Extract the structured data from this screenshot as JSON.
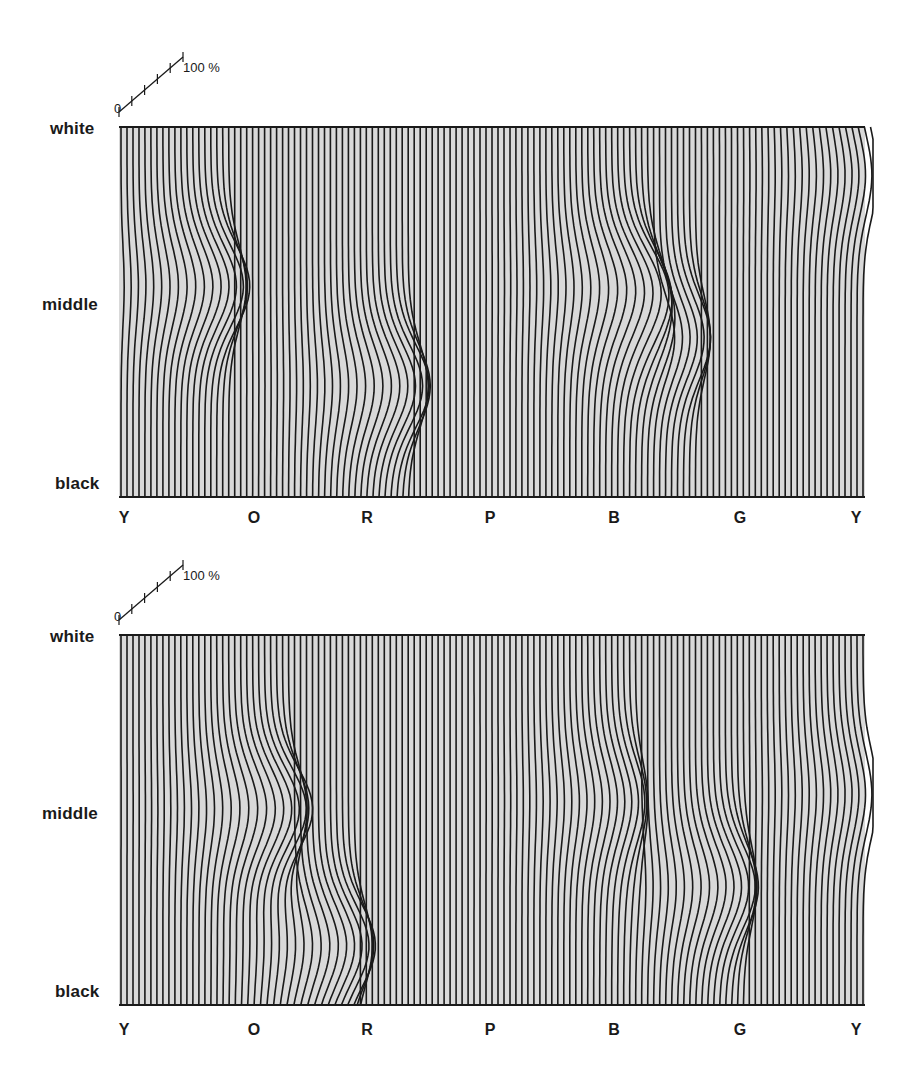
{
  "chart_data": [
    {
      "type": "line",
      "title": "",
      "description": "Hue circle (x) vs. lightness (y, white to black); vertical iso-hue lines displaced horizontally, scale 0-100 %",
      "xlabel": "hue",
      "ylabel": "lightness",
      "x_tick_labels": [
        "Y",
        "O",
        "R",
        "P",
        "B",
        "G",
        "Y"
      ],
      "y_tick_labels": [
        "white",
        "middle",
        "black"
      ],
      "scale_bar": {
        "min_label": "0",
        "max_label": "100 %",
        "ticks": 5
      },
      "line_count": 125,
      "grid": false,
      "deformations": [
        {
          "hue_pos": 0.13,
          "lightness": 0.43,
          "amplitude": 0.55,
          "note": "near O, just above middle"
        },
        {
          "hue_pos": 0.375,
          "lightness": 0.7,
          "amplitude": 0.55,
          "note": "before R, below middle"
        },
        {
          "hue_pos": 0.69,
          "lightness": 0.43,
          "amplitude": 0.55,
          "note": "near B, above middle"
        },
        {
          "hue_pos": 0.76,
          "lightness": 0.57,
          "amplitude": 0.45,
          "note": "between B and G, near middle"
        },
        {
          "hue_pos": 1.0,
          "lightness": 0.13,
          "amplitude": 0.25,
          "note": "at Y, near white"
        }
      ]
    },
    {
      "type": "line",
      "title": "",
      "description": "Second condition: same axes, different displacement pattern",
      "xlabel": "hue",
      "ylabel": "lightness",
      "x_tick_labels": [
        "Y",
        "O",
        "R",
        "P",
        "B",
        "G",
        "Y"
      ],
      "y_tick_labels": [
        "white",
        "middle",
        "black"
      ],
      "scale_bar": {
        "min_label": "0",
        "max_label": "100 %",
        "ticks": 5
      },
      "line_count": 125,
      "grid": false,
      "deformations": [
        {
          "hue_pos": 0.21,
          "lightness": 0.47,
          "amplitude": 0.6,
          "note": "near O, middle"
        },
        {
          "hue_pos": 0.3,
          "lightness": 0.84,
          "amplitude": 0.55,
          "note": "between O and R, near black"
        },
        {
          "hue_pos": 0.68,
          "lightness": 0.45,
          "amplitude": 0.35,
          "note": "B-G region, above middle"
        },
        {
          "hue_pos": 0.82,
          "lightness": 0.68,
          "amplitude": 0.5,
          "note": "before G, below middle"
        },
        {
          "hue_pos": 1.0,
          "lightness": 0.43,
          "amplitude": 0.25,
          "note": "at Y, middle"
        }
      ]
    }
  ],
  "panels": [
    {
      "y_labels": {
        "white": "white",
        "middle": "middle",
        "black": "black"
      },
      "hue_labels": [
        "Y",
        "O",
        "R",
        "P",
        "B",
        "G",
        "Y"
      ],
      "scale": {
        "zero": "0",
        "max": "100 %"
      }
    },
    {
      "y_labels": {
        "white": "white",
        "middle": "middle",
        "black": "black"
      },
      "hue_labels": [
        "Y",
        "O",
        "R",
        "P",
        "B",
        "G",
        "Y"
      ],
      "scale": {
        "zero": "0",
        "max": "100 %"
      }
    }
  ],
  "colors": {
    "line": "#1a1a1a",
    "screen": "#d9d9d9",
    "background": "#ffffff"
  }
}
